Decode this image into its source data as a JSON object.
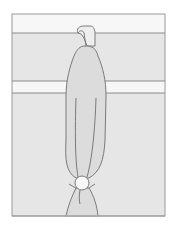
{
  "figure": {
    "colors": {
      "background": "#ffffff",
      "panel_fill": "#e6e6e6",
      "band_fill": "#f7f7f7",
      "curtain_fill": "#dcdcdc",
      "hook_fill": "#eeeeee",
      "knot_fill": "#f8f8f8",
      "stroke": "#7a7a7a"
    },
    "frame": {
      "x": 12,
      "y": 14,
      "width": 153,
      "height": 202
    },
    "bands": [
      {
        "y_top": 14,
        "y_bottom": 33,
        "fill": "band"
      },
      {
        "y_top": 33,
        "y_bottom": 81,
        "fill": "panel"
      },
      {
        "y_top": 81,
        "y_bottom": 93,
        "fill": "band"
      },
      {
        "y_top": 93,
        "y_bottom": 216,
        "fill": "panel"
      }
    ],
    "knot": {
      "cx": 82,
      "cy": 183,
      "r": 7
    }
  }
}
